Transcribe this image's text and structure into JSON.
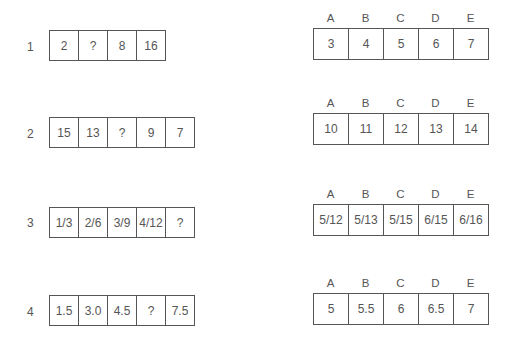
{
  "questions": [
    {
      "number": "1",
      "sequence": [
        "2",
        "?",
        "8",
        "16"
      ],
      "option_labels": [
        "A",
        "B",
        "C",
        "D",
        "E"
      ],
      "options": [
        "3",
        "4",
        "5",
        "6",
        "7"
      ]
    },
    {
      "number": "2",
      "sequence": [
        "15",
        "13",
        "?",
        "9",
        "7"
      ],
      "option_labels": [
        "A",
        "B",
        "C",
        "D",
        "E"
      ],
      "options": [
        "10",
        "11",
        "12",
        "13",
        "14"
      ]
    },
    {
      "number": "3",
      "sequence": [
        "1/3",
        "2/6",
        "3/9",
        "4/12",
        "?"
      ],
      "option_labels": [
        "A",
        "B",
        "C",
        "D",
        "E"
      ],
      "options": [
        "5/12",
        "5/13",
        "5/15",
        "6/15",
        "6/16"
      ]
    },
    {
      "number": "4",
      "sequence": [
        "1.5",
        "3.0",
        "4.5",
        "?",
        "7.5"
      ],
      "option_labels": [
        "A",
        "B",
        "C",
        "D",
        "E"
      ],
      "options": [
        "5",
        "5.5",
        "6",
        "6.5",
        "7"
      ]
    }
  ]
}
